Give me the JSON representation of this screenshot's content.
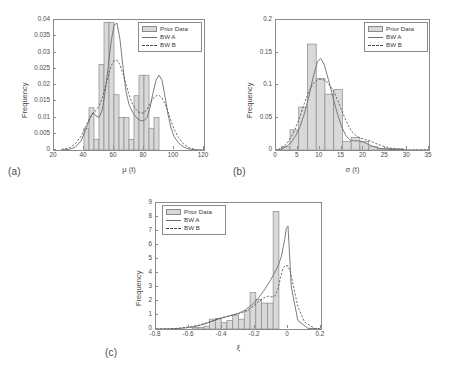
{
  "figure": {
    "background": "#ffffff",
    "bar_fill": "#d9d9d9",
    "bar_stroke": "#8a8a8a",
    "axis_color": "#8a8a8a",
    "curve_a_color": "#6e6e6e",
    "curve_b_color": "#4a4a4a"
  },
  "legend_labels": {
    "prior": "Prior Data",
    "bw_a": "BW A",
    "bw_b": "BW B"
  },
  "panels": {
    "a": {
      "label": "(a)"
    },
    "b": {
      "label": "(b)"
    },
    "c": {
      "label": "(c)"
    }
  },
  "chart_data": [
    {
      "type": "bar",
      "panel": "(a)",
      "title": "",
      "xlabel": "μ (t)",
      "ylabel": "Frequency",
      "xlim": [
        20,
        120
      ],
      "ylim": [
        0,
        0.04
      ],
      "xticks": [
        20,
        40,
        60,
        80,
        100,
        120
      ],
      "xticklabels": [
        "20",
        "40",
        "60",
        "80",
        "100",
        "120"
      ],
      "yticks": [
        0,
        0.005,
        0.01,
        0.015,
        0.02,
        0.025,
        0.03,
        0.035,
        0.04
      ],
      "yticklabels": [
        "0",
        "0.005",
        "0.01",
        "0.015",
        "0.02",
        "0.025",
        "0.03",
        "0.035",
        "0.04"
      ],
      "grid": false,
      "legend": "Prior Data / BW A / BW B",
      "legend_position": "top-right",
      "bin_edges": [
        40,
        43.33,
        46.67,
        50,
        53.33,
        56.67,
        60,
        63.33,
        66.67,
        70,
        73.33,
        76.67,
        80,
        83.33,
        86.67,
        90,
        93.33,
        96.67,
        100,
        103.33
      ],
      "bin_heights": [
        0.0067,
        0.013,
        0.0033,
        0.0263,
        0.0393,
        0.0393,
        0.017,
        0.01,
        0.01,
        0.0033,
        0.0167,
        0.023,
        0.023,
        0.0067,
        0.01
      ],
      "series": [
        {
          "name": "BW A",
          "style": "solid",
          "x": [
            25,
            30,
            34,
            38,
            41,
            44,
            46,
            48,
            50,
            52,
            54,
            56,
            58,
            60,
            62,
            64,
            66,
            68,
            70,
            72,
            74,
            76,
            78,
            80,
            82,
            84,
            86,
            88,
            90,
            92,
            94,
            96,
            98,
            100,
            103,
            106,
            110,
            115,
            120
          ],
          "y": [
            0.0,
            0.0002,
            0.0008,
            0.0028,
            0.006,
            0.0098,
            0.0115,
            0.0105,
            0.01,
            0.012,
            0.0175,
            0.025,
            0.033,
            0.0385,
            0.039,
            0.034,
            0.0255,
            0.018,
            0.014,
            0.012,
            0.0105,
            0.0095,
            0.009,
            0.009,
            0.01,
            0.013,
            0.0175,
            0.0215,
            0.023,
            0.0215,
            0.0165,
            0.011,
            0.0068,
            0.0042,
            0.0022,
            0.001,
            0.0003,
            0.0,
            0.0
          ]
        },
        {
          "name": "BW B",
          "style": "dashed",
          "x": [
            25,
            30,
            34,
            38,
            41,
            44,
            46,
            48,
            50,
            52,
            54,
            56,
            58,
            60,
            62,
            64,
            66,
            68,
            70,
            72,
            74,
            76,
            78,
            80,
            82,
            84,
            86,
            88,
            90,
            92,
            94,
            96,
            98,
            100,
            103,
            106,
            110,
            115,
            120
          ],
          "y": [
            0.0002,
            0.0006,
            0.0018,
            0.0042,
            0.0072,
            0.01,
            0.0113,
            0.0122,
            0.0135,
            0.0158,
            0.019,
            0.0225,
            0.0258,
            0.0275,
            0.0276,
            0.0262,
            0.0235,
            0.0202,
            0.017,
            0.0145,
            0.0128,
            0.0118,
            0.0113,
            0.0115,
            0.0125,
            0.0142,
            0.0158,
            0.0167,
            0.0168,
            0.016,
            0.0142,
            0.0118,
            0.009,
            0.0065,
            0.0038,
            0.002,
            0.0007,
            0.0001,
            0.0
          ]
        }
      ]
    },
    {
      "type": "bar",
      "panel": "(b)",
      "title": "",
      "xlabel": "σ (t)",
      "ylabel": "Frequency",
      "xlim": [
        0,
        35
      ],
      "ylim": [
        0,
        0.2
      ],
      "xticks": [
        0,
        5,
        10,
        15,
        20,
        25,
        30,
        35
      ],
      "xticklabels": [
        "0",
        "5",
        "10",
        "15",
        "20",
        "25",
        "30",
        "35"
      ],
      "yticks": [
        0,
        0.05,
        0.1,
        0.15,
        0.2
      ],
      "yticklabels": [
        "0",
        "0.05",
        "0.1",
        "0.15",
        "0.2"
      ],
      "grid": false,
      "legend": "Prior Data / BW A / BW B",
      "legend_position": "top-right",
      "bin_edges": [
        1.2,
        3.2,
        5.2,
        7.2,
        9.2,
        11.2,
        13.2,
        15.2,
        17.2,
        19.2,
        21.2,
        23.2,
        29.2
      ],
      "bin_heights": [
        0.005,
        0.031,
        0.066,
        0.163,
        0.11,
        0.086,
        0.093,
        0.013,
        0.019,
        0.013,
        0.005,
        0.002
      ],
      "series": [
        {
          "name": "BW A",
          "style": "solid",
          "x": [
            0.5,
            1.5,
            2.5,
            3.5,
            4.5,
            5.5,
            6.5,
            7.5,
            8.5,
            9.5,
            10.2,
            11,
            12,
            13,
            14,
            15,
            16,
            17,
            18,
            19,
            20,
            21,
            22,
            23,
            24,
            26,
            28,
            30,
            32,
            35
          ],
          "y": [
            0.0,
            0.002,
            0.006,
            0.012,
            0.022,
            0.036,
            0.056,
            0.082,
            0.112,
            0.136,
            0.141,
            0.132,
            0.108,
            0.082,
            0.057,
            0.036,
            0.022,
            0.015,
            0.014,
            0.014,
            0.012,
            0.009,
            0.006,
            0.004,
            0.002,
            0.001,
            0.0,
            0.0,
            0.0,
            0.0
          ]
        },
        {
          "name": "BW B",
          "style": "dashed",
          "x": [
            0.5,
            1.5,
            2.5,
            3.5,
            4.5,
            5.5,
            6.5,
            7.5,
            8.5,
            9.5,
            10.5,
            11.5,
            12.5,
            13.5,
            14.5,
            15.5,
            16.5,
            17.5,
            18.5,
            19.5,
            20.5,
            21.5,
            22.5,
            24,
            26,
            28,
            30,
            32,
            35
          ],
          "y": [
            0.001,
            0.004,
            0.01,
            0.02,
            0.034,
            0.052,
            0.072,
            0.09,
            0.102,
            0.108,
            0.109,
            0.106,
            0.098,
            0.086,
            0.07,
            0.053,
            0.038,
            0.027,
            0.021,
            0.018,
            0.016,
            0.014,
            0.011,
            0.007,
            0.003,
            0.001,
            0.0,
            0.0,
            0.0
          ]
        }
      ]
    },
    {
      "type": "bar",
      "panel": "(c)",
      "title": "",
      "xlabel": "ξ",
      "ylabel": "Frequency",
      "xlim": [
        -0.8,
        0.2
      ],
      "ylim": [
        0,
        9
      ],
      "xticks": [
        -0.8,
        -0.6,
        -0.4,
        -0.2,
        0,
        0.2
      ],
      "xticklabels": [
        "-0.8",
        "-0.6",
        "-0.4",
        "-0.2",
        "0",
        "0.2"
      ],
      "yticks": [
        0,
        1,
        2,
        3,
        4,
        5,
        6,
        7,
        8,
        9
      ],
      "yticklabels": [
        "0",
        "1",
        "2",
        "3",
        "4",
        "5",
        "6",
        "7",
        "8",
        "9"
      ],
      "grid": false,
      "legend": "Prior Data / BW A / BW B",
      "legend_position": "top-left",
      "bin_edges": [
        -0.58,
        -0.545,
        -0.51,
        -0.475,
        -0.44,
        -0.405,
        -0.37,
        -0.335,
        -0.3,
        -0.265,
        -0.23,
        -0.195,
        -0.16,
        -0.125,
        -0.09,
        -0.055,
        -0.02,
        0.0
      ],
      "bin_heights": [
        0.1,
        0.1,
        0.2,
        0.7,
        0.75,
        0.45,
        0.6,
        1.0,
        0.7,
        1.3,
        2.6,
        2.1,
        1.85,
        1.85,
        8.4
      ],
      "series": [
        {
          "name": "BW A",
          "style": "solid",
          "x": [
            -0.8,
            -0.72,
            -0.66,
            -0.62,
            -0.58,
            -0.54,
            -0.5,
            -0.46,
            -0.42,
            -0.38,
            -0.34,
            -0.3,
            -0.26,
            -0.22,
            -0.18,
            -0.14,
            -0.11,
            -0.08,
            -0.06,
            -0.04,
            -0.02,
            -0.01,
            0.0,
            0.02,
            0.06,
            0.12,
            0.2
          ],
          "y": [
            0.0,
            0.01,
            0.04,
            0.08,
            0.14,
            0.24,
            0.38,
            0.55,
            0.72,
            0.85,
            0.98,
            1.12,
            1.35,
            1.7,
            2.2,
            2.85,
            3.4,
            4.05,
            4.5,
            5.2,
            6.4,
            7.2,
            7.35,
            3.0,
            0.6,
            0.05,
            0.0
          ]
        },
        {
          "name": "BW B",
          "style": "dashed",
          "x": [
            -0.8,
            -0.72,
            -0.66,
            -0.62,
            -0.58,
            -0.54,
            -0.5,
            -0.46,
            -0.42,
            -0.38,
            -0.34,
            -0.3,
            -0.26,
            -0.22,
            -0.18,
            -0.15,
            -0.12,
            -0.1,
            -0.08,
            -0.06,
            -0.045,
            -0.03,
            -0.015,
            0.0,
            0.015,
            0.03,
            0.06,
            0.1,
            0.16,
            0.2
          ],
          "y": [
            0.0,
            0.02,
            0.06,
            0.11,
            0.18,
            0.28,
            0.42,
            0.58,
            0.75,
            0.88,
            0.98,
            1.08,
            1.25,
            1.55,
            1.95,
            2.2,
            2.35,
            2.3,
            2.35,
            2.9,
            3.7,
            4.35,
            4.55,
            4.5,
            4.05,
            3.2,
            1.6,
            0.5,
            0.05,
            0.0
          ]
        }
      ]
    }
  ]
}
